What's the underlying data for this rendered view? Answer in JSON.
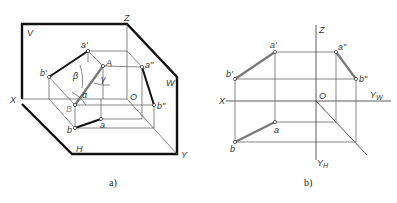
{
  "figure_a": {
    "caption": "a)",
    "planes": {
      "V": "V",
      "H": "H",
      "W": "W"
    },
    "axes": {
      "X": "X",
      "Y": "Y",
      "Z": "Z",
      "O": "O"
    },
    "points": {
      "a_prime": "a'",
      "b_prime": "b'",
      "a_dprime": "a\"",
      "b_dprime": "b\"",
      "a": "a",
      "b": "b",
      "A": "A",
      "B": "B"
    },
    "angles": {
      "alpha": "α",
      "beta": "β",
      "gamma": "γ"
    }
  },
  "figure_b": {
    "caption": "b)",
    "axes": {
      "X": "X",
      "Z": "Z",
      "O": "O",
      "Y_W": "Y",
      "Y_W_sub": "W",
      "Y_H": "Y",
      "Y_H_sub": "H"
    },
    "points": {
      "a_prime": "a'",
      "b_prime": "b'",
      "a_dprime": "a\"",
      "b_dprime": "b\"",
      "a": "a",
      "b": "b"
    }
  },
  "colors": {
    "line": "#111111",
    "segment_gray": "#777777",
    "thin": "#555555"
  }
}
